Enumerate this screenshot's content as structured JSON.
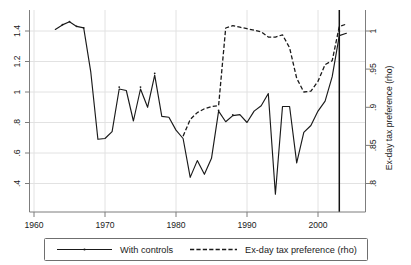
{
  "chart_data": {
    "type": "line",
    "title": "",
    "xlabel": "",
    "ylabel": "",
    "y2label": "Ex-day tax preference (rho)",
    "grid": true,
    "legend_position": "below-outside",
    "xlim": [
      1960,
      2004.8
    ],
    "ylim": [
      0.3,
      1.48
    ],
    "y2lim": [
      0.782,
      1.018
    ],
    "xticks": [
      1960,
      1970,
      1980,
      1990,
      2000
    ],
    "xtick_labels": [
      "1960",
      "1970",
      "1980",
      "1990",
      "2000"
    ],
    "yticks": [
      0.4,
      0.6,
      0.8,
      1.0,
      1.2,
      1.4
    ],
    "ytick_labels": [
      ".4",
      ".6",
      ".8",
      "1",
      "1.2",
      "1.4"
    ],
    "y2ticks": [
      0.8,
      0.85,
      0.9,
      0.95,
      1.0
    ],
    "y2tick_labels": [
      ".8",
      ".85",
      ".9",
      ".95",
      "1"
    ],
    "annotations": [
      {
        "type": "vline",
        "x": 2003,
        "label": ""
      }
    ],
    "series": [
      {
        "name": "With controls",
        "axis": "left",
        "style": "solid",
        "x": [
          1963,
          1964,
          1965,
          1966,
          1967,
          1968,
          1969,
          1970,
          1971,
          1972,
          1973,
          1974,
          1975,
          1976,
          1977,
          1978,
          1979,
          1980,
          1981,
          1982,
          1983,
          1984,
          1985,
          1986,
          1987,
          1988,
          1989,
          1990,
          1991,
          1992,
          1993,
          1994,
          1995,
          1996,
          1997,
          1998,
          1999,
          2000,
          2001,
          2002,
          2003,
          2004
        ],
        "values": [
          1.41,
          1.44,
          1.46,
          1.43,
          1.42,
          1.13,
          0.69,
          0.695,
          0.74,
          1.02,
          1.01,
          0.81,
          1.02,
          0.9,
          1.11,
          0.84,
          0.835,
          0.75,
          0.695,
          0.44,
          0.55,
          0.46,
          0.565,
          0.875,
          0.805,
          0.845,
          0.852,
          0.8,
          0.875,
          0.91,
          0.99,
          0.33,
          0.905,
          0.905,
          0.535,
          0.735,
          0.78,
          0.875,
          0.94,
          1.1,
          1.37,
          1.385
        ]
      },
      {
        "name": "Ex-day tax preference (rho)",
        "axis": "right",
        "style": "dashed",
        "x": [
          1981,
          1982,
          1983,
          1984,
          1985,
          1986,
          1987,
          1988,
          1989,
          1990,
          1991,
          1992,
          1993,
          1994,
          1995,
          1996,
          1997,
          1998,
          1999,
          2000,
          2001,
          2002,
          2003,
          2004
        ],
        "values": [
          0.862,
          0.884,
          0.893,
          0.898,
          0.901,
          0.902,
          1.004,
          1.007,
          1.005,
          1.003,
          1.001,
          0.999,
          0.992,
          0.992,
          0.995,
          0.978,
          0.938,
          0.92,
          0.921,
          0.934,
          0.956,
          0.961,
          1.006,
          1.009
        ]
      }
    ]
  },
  "legend": {
    "entries": [
      {
        "label": "With controls",
        "style": "solid"
      },
      {
        "label": "Ex-day tax preference (rho)",
        "style": "dashed"
      }
    ]
  }
}
